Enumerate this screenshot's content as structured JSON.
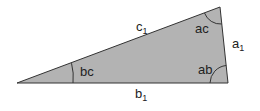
{
  "diagram": {
    "type": "triangle",
    "fill_color": "#b3b3b3",
    "stroke_color": "#333333",
    "sides": {
      "c": {
        "name": "c",
        "subscript": "1"
      },
      "a": {
        "name": "a",
        "subscript": "1"
      },
      "b": {
        "name": "b",
        "subscript": "1"
      }
    },
    "angles": {
      "ac": "ac",
      "bc": "bc",
      "ab": "ab"
    }
  }
}
